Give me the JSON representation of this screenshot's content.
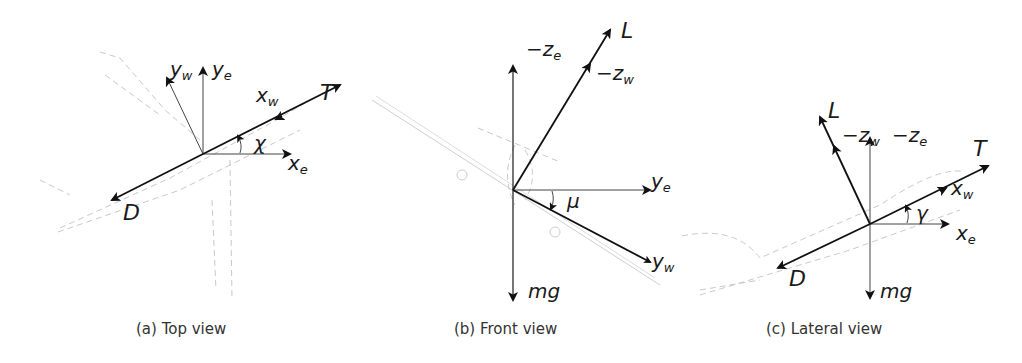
{
  "figure": {
    "panels": [
      {
        "id": "a",
        "caption": "(a)  Top view",
        "labels": {
          "yw": "y",
          "yw_sub": "w",
          "ye": "y",
          "ye_sub": "e",
          "xw": "x",
          "xw_sub": "w",
          "xe": "x",
          "xe_sub": "e",
          "T": "T",
          "D": "D",
          "angle": "χ"
        }
      },
      {
        "id": "b",
        "caption": "(b)  Front view",
        "labels": {
          "ze": "−z",
          "ze_sub": "e",
          "L": "L",
          "zw": "−z",
          "zw_sub": "w",
          "ye": "y",
          "ye_sub": "e",
          "yw": "y",
          "yw_sub": "w",
          "mg": "mg",
          "angle": "μ"
        }
      },
      {
        "id": "c",
        "caption": "(c)  Lateral view",
        "labels": {
          "L": "L",
          "zw": "−z",
          "zw_sub": "w",
          "ze": "−z",
          "ze_sub": "e",
          "T": "T",
          "xw": "x",
          "xw_sub": "w",
          "xe": "x",
          "xe_sub": "e",
          "D": "D",
          "mg": "mg",
          "angle": "γ"
        }
      }
    ],
    "colors": {
      "vector": "#111111",
      "axis": "#444444",
      "aircraft_sketch": "#c9c9c9",
      "caption": "#333333"
    }
  }
}
